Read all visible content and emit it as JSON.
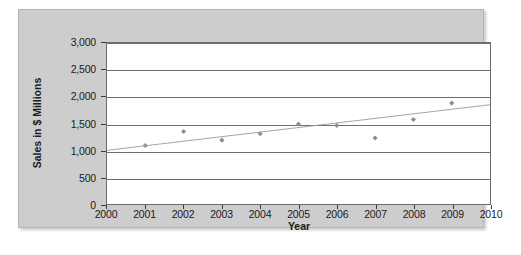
{
  "chart_data": {
    "type": "scatter",
    "title": "",
    "xlabel": "Year",
    "ylabel": "Sales in $ Millions",
    "xlim": [
      2000,
      2010
    ],
    "ylim": [
      0,
      3000
    ],
    "grid": true,
    "legend": "none",
    "x_ticks": [
      "2000",
      "2001",
      "2002",
      "2003",
      "2004",
      "2005",
      "2006",
      "2007",
      "2008",
      "2009",
      "2010"
    ],
    "y_ticks": [
      "0",
      "500",
      "1,000",
      "1,500",
      "2,000",
      "2,500",
      "3,000"
    ],
    "x_tick_values": [
      2000,
      2001,
      2002,
      2003,
      2004,
      2005,
      2006,
      2007,
      2008,
      2009,
      2010
    ],
    "y_tick_values": [
      0,
      500,
      1000,
      1500,
      2000,
      2500,
      3000
    ],
    "series": [
      {
        "name": "Sales",
        "marker": "diamond",
        "color": "#8e8e8e",
        "x": [
          2001,
          2002,
          2003,
          2004,
          2005,
          2006,
          2007,
          2008,
          2009
        ],
        "values": [
          1090,
          1350,
          1190,
          1310,
          1490,
          1465,
          1230,
          1575,
          1880
        ]
      },
      {
        "name": "Trend line",
        "marker": "none",
        "color": "#9a9a9a",
        "x": [
          2000,
          2010
        ],
        "values": [
          1000,
          1850
        ]
      }
    ]
  },
  "margin_note": {
    "line1": "",
    "line2": ""
  }
}
